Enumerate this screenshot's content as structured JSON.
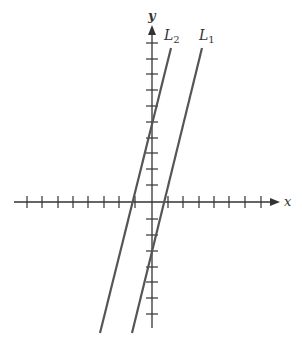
{
  "diagram": {
    "axes": {
      "x_label": "x",
      "y_label": "y",
      "x_ticks": [
        -8,
        -7,
        -6,
        -5,
        -4,
        -3,
        -2,
        -1,
        1,
        2,
        3,
        4,
        5,
        6,
        7
      ],
      "y_ticks": [
        -8,
        -7,
        -6,
        -5,
        -4,
        -3,
        -2,
        -1,
        1,
        2,
        3,
        4,
        5,
        6,
        7,
        8,
        9,
        10
      ]
    },
    "lines": [
      {
        "name": "L2",
        "label_main": "L",
        "label_sub": "2",
        "y_intercept": 5,
        "x_intercept": -1.2
      },
      {
        "name": "L1",
        "label_main": "L",
        "label_sub": "1",
        "y_intercept": -3,
        "x_intercept": 0.8
      }
    ],
    "colors": {
      "axis": "#333333",
      "line": "#555555",
      "background": "#ffffff"
    }
  }
}
